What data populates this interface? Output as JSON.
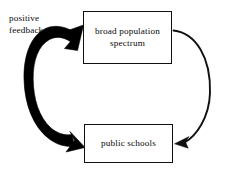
{
  "diagram": {
    "background_color": "#ffffff",
    "stroke_color": "#111111",
    "text_color": "#0a0a0a",
    "nodes": [
      {
        "id": "broad-population-spectrum",
        "label": "broad population\nspectrum",
        "shape": "rectangle"
      },
      {
        "id": "public-schools",
        "label": "public schools",
        "shape": "rectangle"
      }
    ],
    "annotations": [
      {
        "id": "positive-feedback",
        "label": "positive\nfeedback"
      }
    ],
    "edges": [
      {
        "id": "thin-arrow-top-to-bottom",
        "from": "broad-population-spectrum",
        "to": "public-schools",
        "style": "thin-curved",
        "arrowheads": "end",
        "side": "right"
      },
      {
        "id": "thick-arrow-bottom-to-top",
        "from": "public-schools",
        "to": "broad-population-spectrum",
        "style": "thick-tapered-curved",
        "arrowheads": "both",
        "side": "left",
        "annotation": "positive-feedback"
      }
    ]
  }
}
